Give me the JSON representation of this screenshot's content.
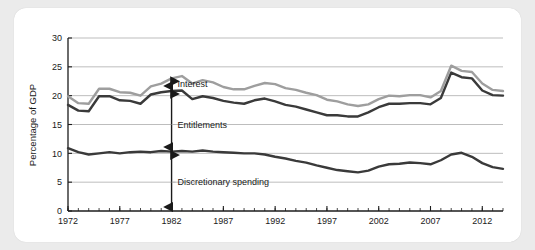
{
  "chart_data": {
    "type": "line",
    "title": "",
    "xlabel": "",
    "ylabel": "Percentage of GDP",
    "xlim": [
      1972,
      2014
    ],
    "ylim": [
      0,
      30
    ],
    "yticks": [
      0,
      5,
      10,
      15,
      20,
      25,
      30
    ],
    "xticks": [
      1972,
      1977,
      1982,
      1987,
      1992,
      1997,
      2002,
      2007,
      2012
    ],
    "grid": "horizontal",
    "legend_position": "inline-annotations",
    "minor_tick_interval": 1,
    "x": [
      1972,
      1973,
      1974,
      1975,
      1976,
      1977,
      1978,
      1979,
      1980,
      1981,
      1982,
      1983,
      1984,
      1985,
      1986,
      1987,
      1988,
      1989,
      1990,
      1991,
      1992,
      1993,
      1994,
      1995,
      1996,
      1997,
      1998,
      1999,
      2000,
      2001,
      2002,
      2003,
      2004,
      2005,
      2006,
      2007,
      2008,
      2009,
      2010,
      2011,
      2012,
      2013,
      2014
    ],
    "series": [
      {
        "name": "Total outlays",
        "color": "#9e9e9e",
        "values": [
          19.9,
          18.7,
          18.6,
          21.2,
          21.2,
          20.6,
          20.5,
          20.0,
          21.6,
          22.1,
          23.0,
          23.4,
          22.1,
          22.7,
          22.3,
          21.5,
          21.1,
          21.1,
          21.7,
          22.2,
          22.0,
          21.3,
          21.0,
          20.5,
          20.1,
          19.3,
          19.0,
          18.5,
          18.2,
          18.5,
          19.4,
          20.0,
          19.9,
          20.1,
          20.1,
          19.7,
          20.8,
          25.2,
          24.3,
          24.1,
          22.1,
          21.0,
          20.8
        ]
      },
      {
        "name": "Entitlements plus discretionary spending",
        "color": "#3a3a3a",
        "values": [
          18.4,
          17.4,
          17.3,
          19.9,
          19.9,
          19.2,
          19.1,
          18.6,
          20.2,
          20.6,
          20.8,
          20.9,
          19.4,
          19.9,
          19.6,
          19.1,
          18.8,
          18.6,
          19.2,
          19.5,
          19.0,
          18.4,
          18.1,
          17.6,
          17.1,
          16.6,
          16.6,
          16.4,
          16.4,
          17.1,
          18.0,
          18.6,
          18.6,
          18.7,
          18.7,
          18.5,
          19.6,
          24.0,
          23.2,
          23.0,
          20.9,
          20.1,
          20.0
        ]
      },
      {
        "name": "Discretionary spending",
        "color": "#3a3a3a",
        "values": [
          10.9,
          10.2,
          9.8,
          10.0,
          10.2,
          10.0,
          10.2,
          10.3,
          10.2,
          10.4,
          10.3,
          10.4,
          10.3,
          10.5,
          10.3,
          10.2,
          10.1,
          10.0,
          10.0,
          9.8,
          9.4,
          9.1,
          8.7,
          8.4,
          7.9,
          7.5,
          7.1,
          6.9,
          6.7,
          7.0,
          7.7,
          8.1,
          8.2,
          8.4,
          8.3,
          8.1,
          8.8,
          9.8,
          10.1,
          9.4,
          8.3,
          7.6,
          7.3
        ]
      }
    ],
    "annotations": [
      {
        "label": "Interest",
        "year": 1982,
        "y_low": 21.0,
        "y_high": 23.2,
        "arrow": "double"
      },
      {
        "label": "Entitlements",
        "year": 1982,
        "y_low": 10.4,
        "y_high": 21.0,
        "arrow": "double"
      },
      {
        "label": "Discretionary spending",
        "year": 1982,
        "y_low": 0.0,
        "y_high": 10.4,
        "arrow": "double"
      }
    ]
  },
  "axis": {
    "y_title": "Percentage of GDP",
    "y_tick_labels": [
      "0",
      "5",
      "10",
      "15",
      "20",
      "25",
      "30"
    ],
    "x_tick_labels": [
      "1972",
      "1977",
      "1982",
      "1987",
      "1992",
      "1997",
      "2002",
      "2007",
      "2012"
    ]
  },
  "annotations": {
    "interest": "Interest",
    "entitlements": "Entitlements",
    "discretionary": "Discretionary spending"
  },
  "colors": {
    "background": "#ebebeb",
    "card": "#ffffff",
    "total_line": "#9e9e9e",
    "dark_line": "#3a3a3a",
    "grid": "#b6b6b6",
    "axis": "#1c1c1c",
    "text": "#1a1a1a"
  }
}
